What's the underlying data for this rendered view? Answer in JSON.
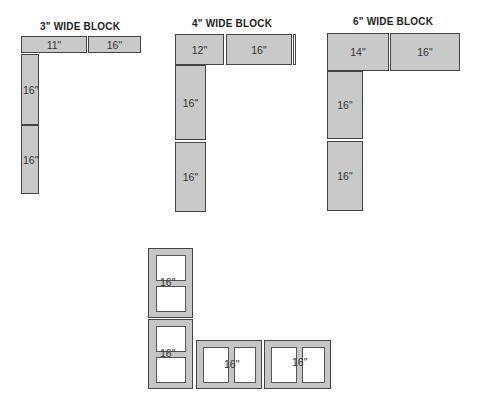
{
  "diagram": {
    "groups": [
      {
        "title": "3\" WIDE BLOCK",
        "top_row": [
          "11\"",
          "16\""
        ],
        "column": [
          "16\"",
          "16\""
        ]
      },
      {
        "title": "4\" WIDE BLOCK",
        "top_row": [
          "12\"",
          "16\""
        ],
        "column": [
          "16\"",
          "16\""
        ]
      },
      {
        "title": "6\" WIDE BLOCK",
        "top_row": [
          "14\"",
          "16\""
        ],
        "column": [
          "16\"",
          "16\""
        ]
      }
    ],
    "hollow_blocks": {
      "column": [
        "16\"",
        "16\""
      ],
      "row": [
        "16\"",
        "16\""
      ]
    }
  }
}
